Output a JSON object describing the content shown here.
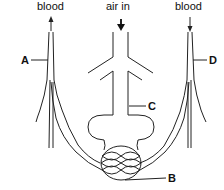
{
  "diagram": {
    "top_labels": {
      "left_flow": "blood",
      "center_flow": "air in",
      "right_flow": "blood"
    },
    "part_labels": {
      "a": "A",
      "b": "B",
      "c": "C",
      "d": "D"
    },
    "arrows": {
      "left_blood": "up",
      "air": "down",
      "right_blood": "down"
    },
    "colors": {
      "stroke": "#222222",
      "background": "#ffffff"
    }
  }
}
